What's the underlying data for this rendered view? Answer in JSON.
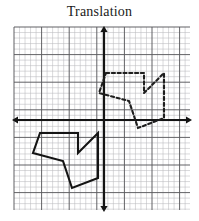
{
  "figure": {
    "title": "Translation",
    "type": "coordinate-grid-diagram",
    "background_color": "#ffffff"
  },
  "grid": {
    "minor_color": "#b9b9bd",
    "major_color": "#5a5a5e",
    "minor_spacing_px": 5.52,
    "major_every": 5,
    "left_px": 14,
    "top_px": 27,
    "right_px": 190,
    "bottom_px": 210,
    "cols": 32,
    "rows": 33,
    "show_grid": true
  },
  "axes": {
    "color": "#141414",
    "stroke_width_px": 2.2,
    "origin_x_px": 104,
    "origin_y_px": 120,
    "x_axis": {
      "label": "x-axis",
      "start_px": 12,
      "end_px": 192,
      "arrow_start": true,
      "arrow_end": true
    },
    "y_axis": {
      "label": "y-axis",
      "start_px": 26,
      "end_px": 212,
      "arrow_start": true,
      "arrow_end": true
    }
  },
  "shapes": [
    {
      "name": "preimage-polygon",
      "style": "solid",
      "color": "#141414",
      "stroke_width_px": 2.1,
      "closed": true,
      "points_px": [
        [
          40,
          133
        ],
        [
          78,
          133
        ],
        [
          78,
          153
        ],
        [
          98,
          133
        ],
        [
          98,
          178
        ],
        [
          72,
          188
        ],
        [
          63,
          161
        ],
        [
          33,
          153
        ]
      ]
    },
    {
      "name": "image-polygon",
      "style": "dashed",
      "color": "#1e1e1e",
      "stroke_width_px": 2.1,
      "dash_pattern": "3.2 2.6",
      "closed": true,
      "points_px": [
        [
          106,
          73
        ],
        [
          144,
          73
        ],
        [
          144,
          93
        ],
        [
          164,
          73
        ],
        [
          164,
          118
        ],
        [
          138,
          128
        ],
        [
          129,
          101
        ],
        [
          99,
          93
        ]
      ]
    }
  ],
  "chart_data": {
    "type": "scatter",
    "title": "Translation",
    "xlabel": "",
    "ylabel": "",
    "grid": true,
    "legend": "none",
    "xlim": [
      -16,
      16
    ],
    "ylim": [
      -16,
      17
    ],
    "series": [
      {
        "name": "Preimage (solid polygon)",
        "linestyle": "solid",
        "color": "#141414",
        "closed": true,
        "x": [
          -11.6,
          -4.7,
          -4.7,
          -1.1,
          -1.1,
          -5.8,
          -7.4,
          -12.9
        ],
        "y": [
          -2.4,
          -2.4,
          -6.0,
          -2.4,
          -10.5,
          -12.3,
          -7.4,
          -6.0
        ]
      },
      {
        "name": "Image (dashed polygon)",
        "linestyle": "dashed",
        "color": "#1e1e1e",
        "closed": true,
        "x": [
          0.4,
          7.2,
          7.2,
          10.9,
          10.9,
          6.2,
          4.5,
          -0.9
        ],
        "y": [
          8.5,
          8.5,
          4.9,
          8.5,
          0.4,
          -1.4,
          3.4,
          4.9
        ]
      }
    ],
    "annotations": [
      {
        "text": "Translation",
        "role": "title"
      }
    ]
  }
}
